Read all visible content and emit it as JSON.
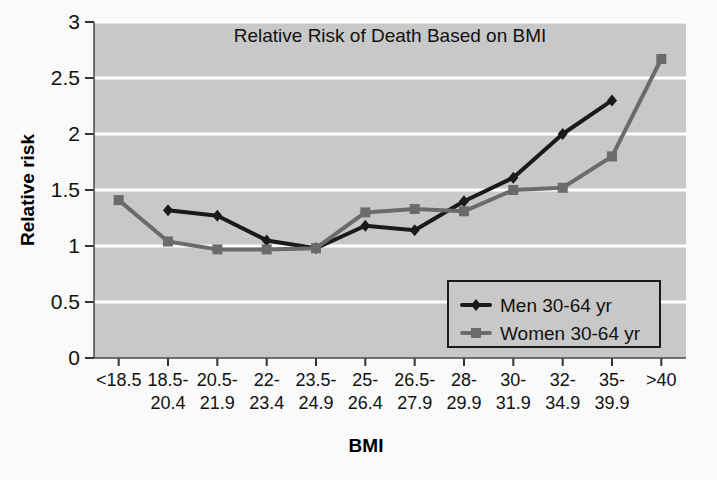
{
  "chart_data": {
    "type": "line",
    "title": "Relative Risk of Death Based on BMI",
    "xlabel": "BMI",
    "ylabel": "Relative risk",
    "ylim": [
      0,
      3
    ],
    "yticks": [
      "0",
      "0.5",
      "1",
      "1.5",
      "2",
      "2.5",
      "3"
    ],
    "ytick_values": [
      0,
      0.5,
      1,
      1.5,
      2,
      2.5,
      3
    ],
    "grid": true,
    "grid_axis": "y",
    "legend_position": "lower-right",
    "categories": [
      "<18.5",
      "18.5-20.4",
      "20.5-21.9",
      "22-23.4",
      "23.5-24.9",
      "25-26.4",
      "26.5-27.9",
      "28-29.9",
      "30-31.9",
      "32-34.9",
      "35-39.9",
      ">40"
    ],
    "categories_display": [
      {
        "line1": "<18.5",
        "line2": ""
      },
      {
        "line1": "18.5-",
        "line2": "20.4"
      },
      {
        "line1": "20.5-",
        "line2": "21.9"
      },
      {
        "line1": "22-",
        "line2": "23.4"
      },
      {
        "line1": "23.5-",
        "line2": "24.9"
      },
      {
        "line1": "25-",
        "line2": "26.4"
      },
      {
        "line1": "26.5-",
        "line2": "27.9"
      },
      {
        "line1": "28-",
        "line2": "29.9"
      },
      {
        "line1": "30-",
        "line2": "31.9"
      },
      {
        "line1": "32-",
        "line2": "34.9"
      },
      {
        "line1": "35-",
        "line2": "39.9"
      },
      {
        "line1": ">40",
        "line2": ""
      }
    ],
    "series": [
      {
        "name": "Men 30-64 yr",
        "color": "#1a1a1a",
        "marker": "diamond",
        "values": [
          null,
          1.32,
          1.27,
          1.05,
          0.98,
          1.18,
          1.14,
          1.4,
          1.61,
          2.0,
          2.3,
          null
        ]
      },
      {
        "name": "Women 30-64 yr",
        "color": "#6b6b6b",
        "marker": "square",
        "values": [
          1.41,
          1.04,
          0.97,
          0.97,
          0.98,
          1.3,
          1.33,
          1.31,
          1.5,
          1.52,
          1.8,
          2.67
        ]
      }
    ]
  },
  "legend": {
    "items": [
      {
        "label": "Men 30-64 yr",
        "color": "#1a1a1a",
        "marker": "diamond"
      },
      {
        "label": "Women 30-64 yr",
        "color": "#6b6b6b",
        "marker": "square"
      }
    ]
  },
  "colors": {
    "plot_background": "#c8c8c8",
    "figure_background": "#fafafa",
    "gridline": "#ffffff",
    "men_line": "#1a1a1a",
    "women_line": "#6b6b6b",
    "text": "#111111"
  }
}
